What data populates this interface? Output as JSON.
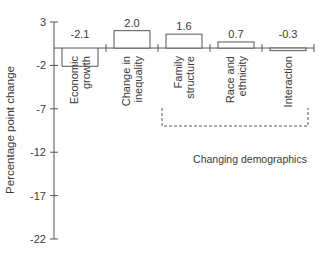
{
  "chart_data": {
    "type": "bar",
    "title": "",
    "xlabel": "",
    "ylabel": "Percentage point change",
    "ylim": [
      -22,
      3
    ],
    "yticks": [
      3,
      -2,
      -7,
      -12,
      -17,
      -22
    ],
    "grid": false,
    "categories": [
      "Economic growth",
      "Change in inequality",
      "Family structure",
      "Race and ethnicity",
      "Interaction"
    ],
    "category_lines": [
      [
        "Economic",
        "growth"
      ],
      [
        "Change in",
        "inequality"
      ],
      [
        "Family",
        "structure"
      ],
      [
        "Race and",
        "ethnicity"
      ],
      [
        "Interaction"
      ]
    ],
    "values": [
      -2.1,
      2.0,
      1.6,
      0.7,
      -0.3
    ],
    "value_labels": [
      "-2.1",
      "2.0",
      "1.6",
      "0.7",
      "-0.3"
    ],
    "group_bracket": {
      "label": "Changing demographics",
      "categories": [
        "Family structure",
        "Race and ethnicity",
        "Interaction"
      ]
    }
  }
}
